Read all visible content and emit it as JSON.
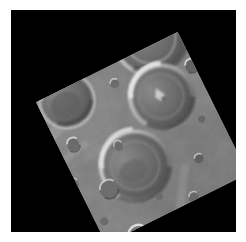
{
  "view": {
    "title": "Cratered Planetary Surface Mosaic",
    "alt_text": "Spacecraft image of a heavily cratered grey planetary surface, shown as a square frame rotated counter-clockwise on a black background",
    "background_color": "#000000",
    "page_color": "#ffffff",
    "frame_rotation_degrees": -26.4,
    "terrain_base_color": "#7d7d7d"
  },
  "scene": {
    "subject": "cratered terrain",
    "illumination_direction": "from the left",
    "frame_corners": {
      "left": "25,87",
      "top": "165,18",
      "right": "222,143",
      "bottom": "88,215"
    }
  },
  "features": {
    "large_craters": [
      {
        "name": "upper-left-crater",
        "cx": 88,
        "cy": 72,
        "r": 21
      },
      {
        "name": "upper-right-crater",
        "cx": 166,
        "cy": 58,
        "r": 28
      },
      {
        "name": "central-bright-rim-crater",
        "cx": 156,
        "cy": 103,
        "r": 24
      },
      {
        "name": "lower-central-crater",
        "cx": 117,
        "cy": 155,
        "r": 26
      }
    ],
    "small_craters": [
      {
        "name": "small-crater-a",
        "cx": 73,
        "cy": 103,
        "r": 4
      },
      {
        "name": "small-crater-b",
        "cx": 119,
        "cy": 70,
        "r": 3
      },
      {
        "name": "small-crater-c",
        "cx": 190,
        "cy": 90,
        "r": 4
      },
      {
        "name": "small-crater-d",
        "cx": 200,
        "cy": 128,
        "r": 4
      },
      {
        "name": "small-crater-e",
        "cx": 104,
        "cy": 128,
        "r": 3
      },
      {
        "name": "small-crater-f",
        "cx": 94,
        "cy": 203,
        "r": 6
      },
      {
        "name": "small-crater-g",
        "cx": 168,
        "cy": 170,
        "r": 3
      },
      {
        "name": "small-crater-h",
        "cx": 92,
        "cy": 149,
        "r": 5
      }
    ]
  },
  "icons": {
    "crater_rim": "crater-rim-icon",
    "central_peak": "central-peak-icon"
  }
}
